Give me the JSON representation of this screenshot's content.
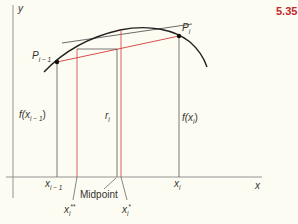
{
  "figure": {
    "number": "5.35",
    "number_color": "#c0282d",
    "axes": {
      "x_label": "x",
      "y_label": "y"
    },
    "points": [
      {
        "name": "P_{i-1}",
        "base": "P",
        "sub": "i − 1"
      },
      {
        "name": "P_i",
        "base": "P",
        "sub": "i"
      }
    ],
    "heights": [
      {
        "name": "f(x_{i-1})",
        "prefix": "f(x",
        "sub": "i − 1",
        "suffix": ")"
      },
      {
        "name": "r_i",
        "base": "r",
        "sub": "i"
      },
      {
        "name": "f(x_i)",
        "prefix": "f(x",
        "sub": "i",
        "suffix": ")"
      }
    ],
    "x_ticks": [
      {
        "name": "x_{i-1}",
        "base": "x",
        "sub": "i − 1"
      },
      {
        "name": "x_i",
        "base": "x",
        "sub": "i"
      }
    ],
    "annotations": {
      "midpoint": "Midpoint",
      "x_i_double_star": {
        "base": "x",
        "sub": "i",
        "sup": "**"
      },
      "x_i_star": {
        "base": "x",
        "sub": "i",
        "sup": "*"
      }
    },
    "colors": {
      "curve": "#222222",
      "axis": "#777777",
      "chord": "#d23a3a",
      "red_vertical": "#d23a3a",
      "guide": "#555555"
    }
  }
}
